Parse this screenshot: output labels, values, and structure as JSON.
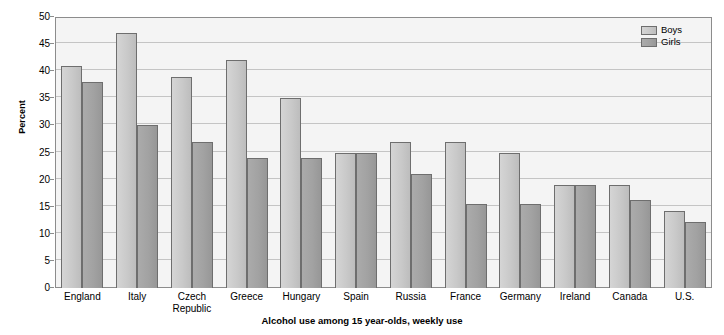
{
  "chart_data": {
    "type": "bar",
    "title": "",
    "xlabel": "Alcohol use among 15 year-olds, weekly use",
    "ylabel": "Percent",
    "ylim": [
      0,
      50
    ],
    "ytick_step": 5,
    "yticks": [
      "0",
      "5",
      "10",
      "15",
      "20",
      "25",
      "30",
      "35",
      "40",
      "45",
      "50"
    ],
    "grid": true,
    "legend_position": "top-right",
    "categories": [
      "England",
      "Italy",
      "Czech Republic",
      "Greece",
      "Hungary",
      "Spain",
      "Russia",
      "France",
      "Germany",
      "Ireland",
      "Canada",
      "U.S."
    ],
    "series": [
      {
        "name": "Boys",
        "color": "#c9c9c9",
        "values": [
          41,
          47,
          39,
          42,
          35,
          25,
          27,
          27,
          25,
          19,
          19,
          14.3
        ]
      },
      {
        "name": "Girls",
        "color": "#a2a2a2",
        "values": [
          38,
          30,
          27,
          24,
          24,
          25,
          21,
          15.5,
          15.5,
          19,
          16.3,
          12.2
        ]
      }
    ]
  },
  "legend": {
    "items": [
      {
        "label": "Boys"
      },
      {
        "label": "Girls"
      }
    ]
  },
  "colors": {
    "boys": "#c9c9c9",
    "girls": "#a2a2a2",
    "plot_background": "#f4f4f4",
    "gridline": "#c4c4c4",
    "axis": "#8c8c8c",
    "bar_border": "#6e6e6e"
  }
}
